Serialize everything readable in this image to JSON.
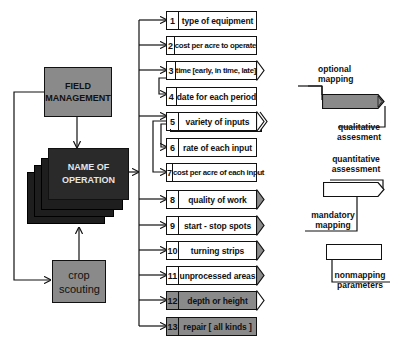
{
  "nodes": {
    "field_management": "FIELD MANAGEMENT",
    "name_of_operation": "NAME OF OPERATION",
    "crop_scouting": "crop scouting"
  },
  "items": [
    {
      "num": "1",
      "label": "type of equipment",
      "fill": "white",
      "arrow": "none"
    },
    {
      "num": "2",
      "label": "cost per acre to operate",
      "fill": "white",
      "arrow": "none"
    },
    {
      "num": "3",
      "label": "time [early, in time, late]",
      "fill": "white",
      "arrow": "white"
    },
    {
      "num": "4",
      "label": "date for each period",
      "fill": "white",
      "arrow": "none"
    },
    {
      "num": "5",
      "label": "variety of inputs",
      "fill": "white",
      "arrow": "white-double"
    },
    {
      "num": "6",
      "label": "rate of each input",
      "fill": "white",
      "arrow": "none"
    },
    {
      "num": "7",
      "label": "cost per acre of each input",
      "fill": "white",
      "arrow": "none"
    },
    {
      "num": "8",
      "label": "quality of work",
      "fill": "white",
      "arrow": "gray"
    },
    {
      "num": "9",
      "label": "start - stop  spots",
      "fill": "white",
      "arrow": "gray"
    },
    {
      "num": "10",
      "label": "turning  strips",
      "fill": "white",
      "arrow": "gray"
    },
    {
      "num": "11",
      "label": "unprocessed areas",
      "fill": "white",
      "arrow": "gray"
    },
    {
      "num": "12",
      "label": "depth  or  height",
      "fill": "gray",
      "arrow": "white"
    },
    {
      "num": "13",
      "label": "repair [ all kinds ]",
      "fill": "gray",
      "arrow": "none"
    }
  ],
  "legend": {
    "optional_mapping": "optional mapping",
    "qualitative_assessment": "qualitative assesment",
    "quantitative_assessment": "quantitative assessment",
    "mandatory_mapping": "mandatory mapping",
    "nonmapping_parameters": "nonmapping parameters"
  },
  "colors": {
    "gray_fill": "#8a8a8a",
    "dark_fill": "#2a2a2a",
    "line": "#111111"
  }
}
